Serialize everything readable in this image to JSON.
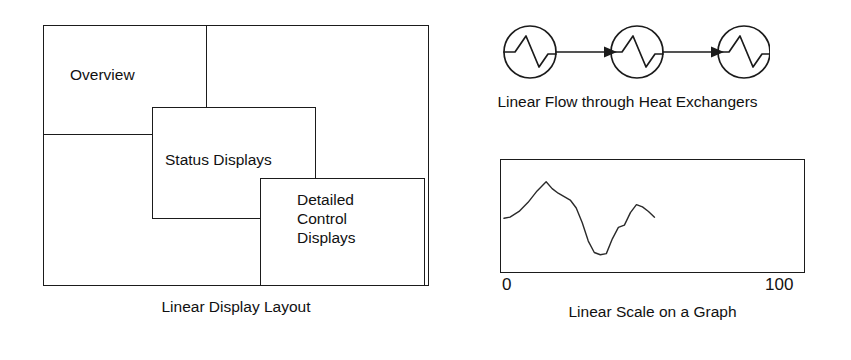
{
  "figure": {
    "left_panel": {
      "caption": "Linear Display Layout",
      "boxes": [
        {
          "name": "overview",
          "label": "Overview"
        },
        {
          "name": "status-displays",
          "label": "Status Displays"
        },
        {
          "name": "detailed-control-displays",
          "label": "Detailed\nControl\nDisplays"
        }
      ]
    },
    "right_panel": {
      "flow_diagram": {
        "caption": "Linear Flow through Heat Exchangers",
        "node_count": 3,
        "node_icon": "heat-exchanger-symbol",
        "connector_icon": "arrow-right-icon"
      },
      "graph": {
        "caption": "Linear Scale on a Graph",
        "axis_min_label": "0",
        "axis_max_label": "100"
      }
    }
  },
  "chart_data": {
    "type": "line",
    "title": "Linear Scale on a Graph",
    "xlabel": "",
    "ylabel": "",
    "xlim": [
      0,
      100
    ],
    "ylim": [
      0,
      100
    ],
    "grid": false,
    "legend": null,
    "xtick_labels": [
      "0",
      "100"
    ],
    "xtick_values": [
      0,
      100
    ],
    "series": [
      {
        "name": "trace",
        "x": [
          0,
          2,
          5,
          8,
          11,
          14,
          16,
          18,
          20,
          22,
          24,
          26,
          28,
          30,
          32,
          34,
          36,
          38,
          40,
          42,
          44,
          46,
          48,
          50
        ],
        "y": [
          48,
          49,
          54,
          62,
          72,
          80,
          74,
          70,
          67,
          64,
          57,
          44,
          28,
          18,
          16,
          17,
          30,
          40,
          42,
          53,
          60,
          58,
          54,
          49
        ]
      }
    ]
  },
  "colors": {
    "stroke": "#1b1b1b",
    "background": "#ffffff",
    "text": "#111111"
  }
}
